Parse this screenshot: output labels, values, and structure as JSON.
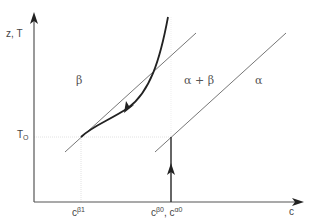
{
  "diagram": {
    "axes": {
      "y_label": "z, T",
      "x_label": "c"
    },
    "regions": {
      "beta": "β",
      "alpha_beta": "α + β",
      "alpha": "α"
    },
    "y_ticks": {
      "T0_main": "T",
      "T0_sub": "O"
    },
    "x_ticks": {
      "c_beta1_main": "c",
      "c_beta1_sup": "β1",
      "c_beta0_main": "c",
      "c_beta0_sup": "β0",
      "separator": ", ",
      "c_alpha0_main": "c",
      "c_alpha0_sup": "α0"
    },
    "colors": {
      "axis": "#555555",
      "thin_line": "#666666",
      "curve": "#222222",
      "guide": "#dddddd"
    }
  }
}
